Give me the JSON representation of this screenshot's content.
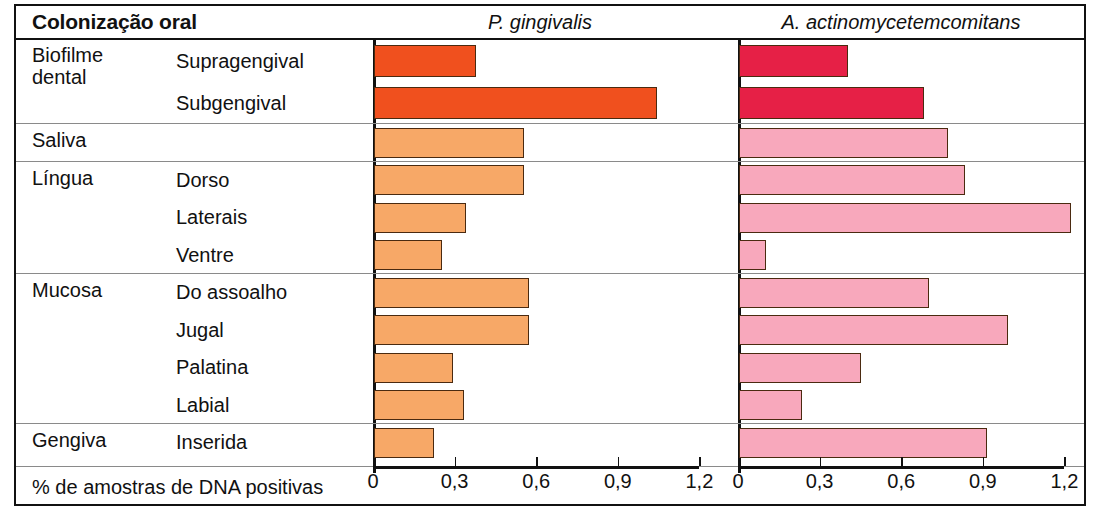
{
  "header": {
    "title": "Colonização oral",
    "species": [
      "P. gingivalis",
      "A. actinomycetemcomitans"
    ]
  },
  "axis": {
    "caption": "% de amostras de DNA positivas",
    "ticks": [
      "0",
      "0,3",
      "0,6",
      "0,9",
      "1,2"
    ],
    "tickvalues": [
      0,
      0.3,
      0.6,
      0.9,
      1.2
    ],
    "min": 0,
    "max": 1.2
  },
  "colors": {
    "biofilm_pg": "#F0501E",
    "other_pg": "#F7A867",
    "biofilm_aa": "#E62046",
    "other_aa": "#F8A8BC",
    "bar_outline": "#4a2a10",
    "frame": "#111111",
    "separator": "#8a8a8a"
  },
  "groups": [
    {
      "category": "Biofilme dental",
      "rows": [
        {
          "sublabel": "Supragengival",
          "pg": 0.375,
          "aa": 0.4
        },
        {
          "sublabel": "Subgengival",
          "pg": 1.04,
          "aa": 0.68
        }
      ]
    },
    {
      "category": "Saliva",
      "rows": [
        {
          "sublabel": "",
          "pg": 0.55,
          "aa": 0.77
        }
      ]
    },
    {
      "category": "Língua",
      "rows": [
        {
          "sublabel": "Dorso",
          "pg": 0.55,
          "aa": 0.83
        },
        {
          "sublabel": "Laterais",
          "pg": 0.34,
          "aa": 1.22
        },
        {
          "sublabel": "Ventre",
          "pg": 0.25,
          "aa": 0.1
        }
      ]
    },
    {
      "category": "Mucosa",
      "rows": [
        {
          "sublabel": "Do assoalho",
          "pg": 0.57,
          "aa": 0.7
        },
        {
          "sublabel": "Jugal",
          "pg": 0.57,
          "aa": 0.99
        },
        {
          "sublabel": "Palatina",
          "pg": 0.29,
          "aa": 0.45
        },
        {
          "sublabel": "Labial",
          "pg": 0.33,
          "aa": 0.23
        }
      ]
    },
    {
      "category": "Gengiva",
      "rows": [
        {
          "sublabel": "Inserida",
          "pg": 0.22,
          "aa": 0.91
        }
      ]
    }
  ],
  "chart_data": {
    "type": "bar",
    "title": "Colonização oral",
    "xlabel": "% de amostras de DNA positivas",
    "ylabel": "",
    "xlim": [
      0,
      1.2
    ],
    "grid": false,
    "orientation": "horizontal",
    "legend": "none",
    "panels": [
      "P. gingivalis",
      "A. actinomycetemcomitans"
    ],
    "categories": [
      "Biofilme dental – Supragengival",
      "Biofilme dental – Subgengival",
      "Saliva",
      "Língua – Dorso",
      "Língua – Laterais",
      "Língua – Ventre",
      "Mucosa – Do assoalho",
      "Mucosa – Jugal",
      "Mucosa – Palatina",
      "Mucosa – Labial",
      "Gengiva – Inserida"
    ],
    "series": [
      {
        "name": "P. gingivalis",
        "values": [
          0.375,
          1.04,
          0.55,
          0.55,
          0.34,
          0.25,
          0.57,
          0.57,
          0.29,
          0.33,
          0.22
        ]
      },
      {
        "name": "A. actinomycetemcomitans",
        "values": [
          0.4,
          0.68,
          0.77,
          0.83,
          1.22,
          0.1,
          0.7,
          0.99,
          0.45,
          0.23,
          0.91
        ]
      }
    ],
    "xticks": [
      0,
      0.3,
      0.6,
      0.9,
      1.2
    ],
    "xticklabels": [
      "0",
      "0,3",
      "0,6",
      "0,9",
      "1,2"
    ]
  }
}
